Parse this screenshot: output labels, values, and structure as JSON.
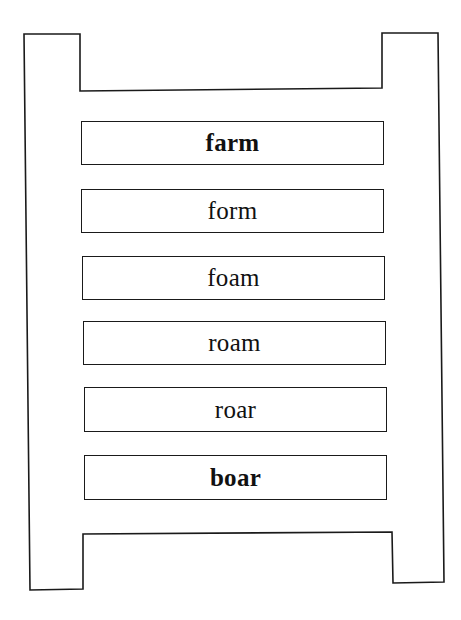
{
  "diagram": {
    "type": "word-ladder",
    "start_word": "farm",
    "end_word": "boar",
    "rungs": [
      {
        "word": "farm",
        "bold": true
      },
      {
        "word": "form",
        "bold": false
      },
      {
        "word": "foam",
        "bold": false
      },
      {
        "word": "roam",
        "bold": false
      },
      {
        "word": "roar",
        "bold": false
      },
      {
        "word": "boar",
        "bold": true
      }
    ],
    "colors": {
      "line": "#1a1a1a",
      "background": "#ffffff",
      "text": "#111111"
    }
  }
}
